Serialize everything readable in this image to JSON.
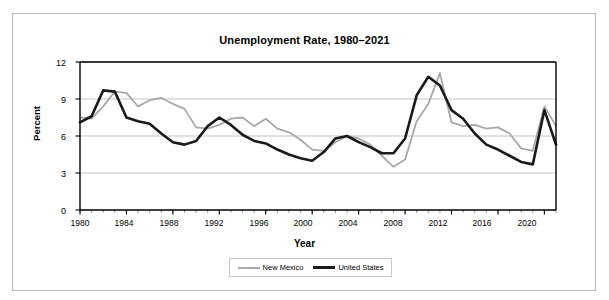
{
  "figure": {
    "title": "Unemployment Rate, 1980–2021",
    "xlabel": "Year",
    "ylabel": "Percent"
  },
  "legend": {
    "items": [
      {
        "label": "New Mexico",
        "color": "#a8a8a8"
      },
      {
        "label": "United States",
        "color": "#1a1a1a"
      }
    ]
  },
  "axes": {
    "ytick_labels": [
      "12",
      "9",
      "6",
      "3",
      "0"
    ],
    "xtick_labels": [
      "1980",
      "1984",
      "1988",
      "1992",
      "1996",
      "2000",
      "2004",
      "2008",
      "2012",
      "2016",
      "2020"
    ]
  },
  "chart_data": {
    "type": "line",
    "title": "Unemployment Rate, 1980–2021",
    "xlabel": "Year",
    "ylabel": "Percent",
    "xlim": [
      1980,
      2021
    ],
    "ylim": [
      0,
      12
    ],
    "yticks": [
      0,
      3,
      6,
      9,
      12
    ],
    "xticks": [
      1980,
      1984,
      1988,
      1992,
      1996,
      2000,
      2004,
      2008,
      2012,
      2016,
      2020
    ],
    "grid": "horizontal",
    "legend_position": "bottom",
    "x": [
      1980,
      1981,
      1982,
      1983,
      1984,
      1985,
      1986,
      1987,
      1988,
      1989,
      1990,
      1991,
      1992,
      1993,
      1994,
      1995,
      1996,
      1997,
      1998,
      1999,
      2000,
      2001,
      2002,
      2003,
      2004,
      2005,
      2006,
      2007,
      2008,
      2009,
      2010,
      2011,
      2012,
      2013,
      2014,
      2015,
      2016,
      2017,
      2018,
      2019,
      2020,
      2021
    ],
    "series": [
      {
        "name": "New Mexico",
        "color": "#a8a8a8",
        "values": [
          7.5,
          7.4,
          8.4,
          9.6,
          9.5,
          8.4,
          8.9,
          9.1,
          8.6,
          8.2,
          6.7,
          6.6,
          6.9,
          7.4,
          7.5,
          6.8,
          7.4,
          6.6,
          6.3,
          5.7,
          4.9,
          4.8,
          5.5,
          6.0,
          5.8,
          5.3,
          4.4,
          3.5,
          4.1,
          7.2,
          8.6,
          11.1,
          7.1,
          6.8,
          6.9,
          6.6,
          6.7,
          6.2,
          5.0,
          4.8,
          8.4,
          6.8
        ]
      },
      {
        "name": "United States",
        "color": "#1a1a1a",
        "values": [
          7.1,
          7.6,
          9.7,
          9.6,
          7.5,
          7.2,
          7.0,
          6.2,
          5.5,
          5.3,
          5.6,
          6.8,
          7.5,
          6.9,
          6.1,
          5.6,
          5.4,
          4.9,
          4.5,
          4.2,
          4.0,
          4.7,
          5.8,
          6.0,
          5.5,
          5.1,
          4.6,
          4.6,
          5.8,
          9.3,
          10.8,
          10.1,
          8.1,
          7.4,
          6.2,
          5.3,
          4.9,
          4.4,
          3.9,
          3.7,
          8.1,
          5.3
        ]
      }
    ]
  }
}
